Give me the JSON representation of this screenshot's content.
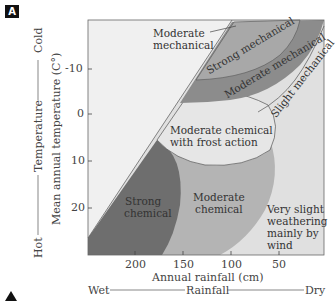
{
  "panel_label": "A",
  "y_axis": {
    "outer_label_hot": "Hot",
    "outer_label_mid": "Temperature",
    "outer_label_cold": "Cold",
    "inner_label": "Mean annual temperature (C°)",
    "ticks": [
      "-10",
      "0",
      "10",
      "20"
    ]
  },
  "x_axis": {
    "ticks": [
      "200",
      "150",
      "100",
      "50"
    ],
    "label": "Annual rainfall (cm)",
    "outer_wet": "Wet",
    "outer_mid": "Rainfall",
    "outer_dry": "Dry"
  },
  "regions": {
    "moderate_mechanical_top": [
      "Moderate",
      "mechanical"
    ],
    "strong_mechanical": "Strong mechanical",
    "moderate_mechanical_band": "Moderate mechanical",
    "slight_mechanical": "Slight mechanical",
    "moderate_chemical_frost": [
      "Moderate chemical",
      "with frost action"
    ],
    "strong_chemical": [
      "Strong",
      "chemical"
    ],
    "moderate_chemical": [
      "Moderate",
      "chemical"
    ],
    "very_slight": [
      "Very slight",
      "weathering",
      "mainly by",
      "wind"
    ]
  },
  "colors": {
    "background_plot": "#f0f0f0",
    "light_zone": "#dedede",
    "moderate_mech_band": "#8a8a8a",
    "strong_mech": "#a6a6a6",
    "strong_chemical": "#6e6e6e",
    "moderate_chemical": "#b2b2b2",
    "frost_zone": "#e2e2e2"
  }
}
